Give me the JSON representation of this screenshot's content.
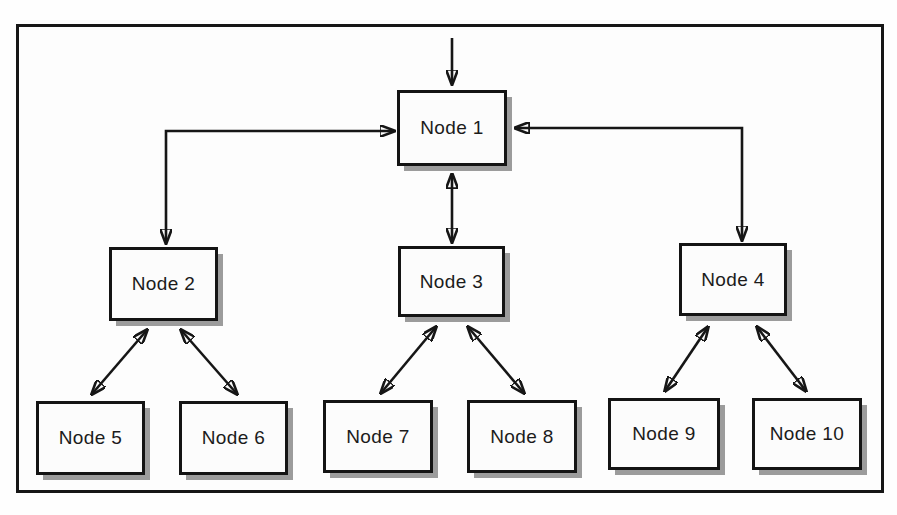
{
  "diagram": {
    "type": "tree-topology",
    "nodes": [
      {
        "id": "node-1",
        "label": "Node 1"
      },
      {
        "id": "node-2",
        "label": "Node 2"
      },
      {
        "id": "node-3",
        "label": "Node 3"
      },
      {
        "id": "node-4",
        "label": "Node 4"
      },
      {
        "id": "node-5",
        "label": "Node 5"
      },
      {
        "id": "node-6",
        "label": "Node 6"
      },
      {
        "id": "node-7",
        "label": "Node 7"
      },
      {
        "id": "node-8",
        "label": "Node 8"
      },
      {
        "id": "node-9",
        "label": "Node 9"
      },
      {
        "id": "node-10",
        "label": "Node 10"
      }
    ],
    "edges": [
      {
        "from": "outside",
        "to": "node-1",
        "direction": "one-way"
      },
      {
        "from": "node-1",
        "to": "node-2",
        "direction": "two-way"
      },
      {
        "from": "node-1",
        "to": "node-3",
        "direction": "two-way"
      },
      {
        "from": "node-1",
        "to": "node-4",
        "direction": "two-way"
      },
      {
        "from": "node-2",
        "to": "node-5",
        "direction": "two-way"
      },
      {
        "from": "node-2",
        "to": "node-6",
        "direction": "two-way"
      },
      {
        "from": "node-3",
        "to": "node-7",
        "direction": "two-way"
      },
      {
        "from": "node-3",
        "to": "node-8",
        "direction": "two-way"
      },
      {
        "from": "node-4",
        "to": "node-9",
        "direction": "two-way"
      },
      {
        "from": "node-4",
        "to": "node-10",
        "direction": "two-way"
      }
    ],
    "colors": {
      "line": "#161616",
      "box_border": "#141414",
      "box_fill": "#fcfcfc",
      "shadow": "#9c9c9c",
      "background": "#fdfdfd"
    }
  }
}
